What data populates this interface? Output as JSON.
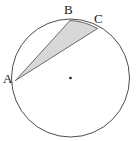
{
  "figure": {
    "kind": "circle-geometry-diagram",
    "background_color": "#ffffff",
    "stroke_color": "#4d4d4d",
    "shade_color": "#d8d8d8",
    "shade_stroke_color": "#6b6b6b",
    "label_color": "#1a1a1a",
    "circle": {
      "center_x": 70.5,
      "center_y": 78.0,
      "radius": 59.0,
      "stroke_width": 1.0
    },
    "center_dot": {
      "name": "center",
      "x": 70.5,
      "y": 78.0,
      "radius": 1.3,
      "color": "#1a1a1a"
    },
    "points": [
      {
        "id": "A",
        "label": "A",
        "x": 15.5,
        "y": 80.5,
        "label_x": 3,
        "label_y": 72
      },
      {
        "id": "B",
        "label": "B",
        "x": 70.0,
        "y": 20.5,
        "label_x": 64,
        "label_y": 3
      },
      {
        "id": "C",
        "label": "C",
        "x": 97.5,
        "y": 28.5,
        "label_x": 94,
        "label_y": 12
      }
    ],
    "segments": [
      {
        "id": "AB",
        "from": "A",
        "to": "B",
        "type": "chord"
      },
      {
        "id": "AC",
        "from": "A",
        "to": "C",
        "type": "chord"
      },
      {
        "id": "BC",
        "from": "B",
        "to": "C",
        "type": "chord"
      }
    ],
    "arcs": [
      {
        "id": "BC-minor",
        "from": "B",
        "to": "C",
        "sweep": "minor",
        "direction": "clockwise"
      }
    ],
    "shaded_region": {
      "id": "ABC-segment-region",
      "boundary": [
        "A",
        "B",
        "arc BC",
        "C",
        "A"
      ],
      "fill": "#d8d8d8"
    },
    "paths": {
      "circle_outline": "M 11.5 78 A 59 59 0 1 1 129.5 78 A 59 59 0 1 1 11.5 78 Z",
      "shaded_region": "M 15.5 80.5 L 70 20.5 A 59 59 0 0 1 97.5 28.5 Z",
      "chord_ab": "M 15.5 80.5 L 70 20.5",
      "chord_ac": "M 15.5 80.5 L 97.5 28.5",
      "arc_bc": "M 70 20.5 A 59 59 0 0 1 97.5 28.5"
    }
  }
}
